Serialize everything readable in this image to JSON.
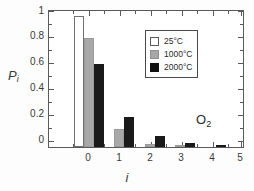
{
  "chart_data": {
    "type": "bar",
    "title": "",
    "subtitle": "",
    "xlabel": "i",
    "ylabel": "P",
    "ylabel_sub": "i",
    "categories": [
      "0",
      "1",
      "2",
      "3",
      "4",
      "5"
    ],
    "series": [
      {
        "name": "25°C",
        "color": "#ffffff",
        "values": [
          1.0,
          0.0,
          0.0,
          0.0,
          0.0,
          0.0
        ]
      },
      {
        "name": "1000°C",
        "color": "#a8a8a8",
        "values": [
          0.83,
          0.14,
          0.022,
          0.004,
          0.0,
          0.0
        ]
      },
      {
        "name": "2000°C",
        "color": "#1a1a1a",
        "values": [
          0.63,
          0.23,
          0.085,
          0.027,
          0.009,
          0.003
        ]
      }
    ],
    "ylim": [
      0,
      1.05
    ],
    "ytick_labels": [
      "0",
      "0.2",
      "0.4",
      "0.6",
      "0.8",
      "1"
    ],
    "ytick_values": [
      0,
      0.2,
      0.4,
      0.6,
      0.8,
      1
    ],
    "yminor_values": [
      0.1,
      0.3,
      0.5,
      0.7,
      0.9
    ],
    "xtick_labels": [
      "0",
      "1",
      "2",
      "3",
      "4",
      "5"
    ],
    "grid": false,
    "frame": "box",
    "legend_position": "upper-right",
    "annotations": [
      {
        "text": "O",
        "sub": "2",
        "x": 4.55,
        "y": 0.26
      }
    ]
  },
  "legend": {
    "entries": [
      {
        "label": "25°C",
        "swatch": "open-square-swatch"
      },
      {
        "label": "1000°C",
        "swatch": "gray-square-swatch"
      },
      {
        "label": "2000°C",
        "swatch": "black-square-swatch"
      }
    ]
  },
  "axes": {
    "y_title_main": "P",
    "y_title_sub": "i",
    "x_title": "i",
    "y_ticks": [
      "1",
      "0.8",
      "0.6",
      "0.4",
      "0.2",
      "0"
    ],
    "x_ticks": [
      "0",
      "1",
      "2",
      "3",
      "4",
      "5"
    ]
  },
  "annotation": {
    "species_main": "O",
    "species_sub": "2"
  }
}
